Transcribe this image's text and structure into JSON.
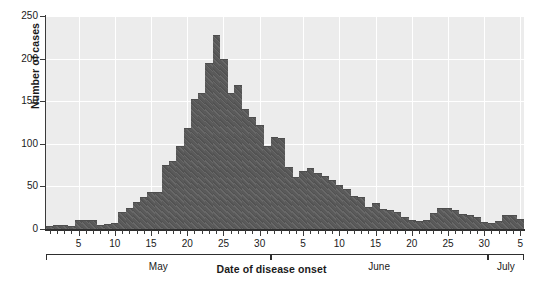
{
  "chart_data": {
    "type": "bar",
    "title": "",
    "xlabel": "Date of disease onset",
    "ylabel": "Number of cases",
    "ylim": [
      0,
      250
    ],
    "ytick_labels": [
      "0",
      "50",
      "100",
      "150",
      "200",
      "250"
    ],
    "ytick_values": [
      0,
      50,
      100,
      150,
      200,
      250
    ],
    "grid": "horizontal-and-vertical white gridlines on gray panel",
    "legend": "none",
    "bar_color": "#5a5a5a",
    "panel_color": "#ececec",
    "gridline_color": "#ffffff",
    "axis_color": "#2e2e2e",
    "month_groups": [
      {
        "label": "May",
        "start_index": 0,
        "end_index": 30,
        "tick_days": [
          5,
          10,
          15,
          20,
          25,
          30
        ]
      },
      {
        "label": "June",
        "start_index": 31,
        "end_index": 60,
        "tick_days": [
          5,
          10,
          15,
          20,
          25,
          30
        ]
      },
      {
        "label": "July",
        "start_index": 61,
        "end_index": 65,
        "tick_days": [
          5
        ]
      }
    ],
    "categories": [
      "May 1",
      "May 2",
      "May 3",
      "May 4",
      "May 5",
      "May 6",
      "May 7",
      "May 8",
      "May 9",
      "May 10",
      "May 11",
      "May 12",
      "May 13",
      "May 14",
      "May 15",
      "May 16",
      "May 17",
      "May 18",
      "May 19",
      "May 20",
      "May 21",
      "May 22",
      "May 23",
      "May 24",
      "May 25",
      "May 26",
      "May 27",
      "May 28",
      "May 29",
      "May 30",
      "May 31",
      "Jun 1",
      "Jun 2",
      "Jun 3",
      "Jun 4",
      "Jun 5",
      "Jun 6",
      "Jun 7",
      "Jun 8",
      "Jun 9",
      "Jun 10",
      "Jun 11",
      "Jun 12",
      "Jun 13",
      "Jun 14",
      "Jun 15",
      "Jun 16",
      "Jun 17",
      "Jun 18",
      "Jun 19",
      "Jun 20",
      "Jun 21",
      "Jun 22",
      "Jun 23",
      "Jun 24",
      "Jun 25",
      "Jun 26",
      "Jun 27",
      "Jun 28",
      "Jun 29",
      "Jun 30",
      "Jul 1",
      "Jul 2",
      "Jul 3",
      "Jul 4",
      "Jul 5"
    ],
    "values": [
      4,
      5,
      5,
      3,
      10,
      11,
      11,
      5,
      6,
      7,
      20,
      25,
      32,
      37,
      44,
      43,
      75,
      80,
      97,
      118,
      153,
      160,
      195,
      228,
      199,
      160,
      169,
      141,
      131,
      122,
      98,
      108,
      107,
      73,
      61,
      68,
      72,
      66,
      62,
      58,
      52,
      47,
      39,
      38,
      26,
      31,
      23,
      22,
      20,
      14,
      10,
      9,
      11,
      19,
      25,
      25,
      22,
      18,
      17,
      14,
      8,
      7,
      9,
      17,
      16,
      12
    ]
  }
}
